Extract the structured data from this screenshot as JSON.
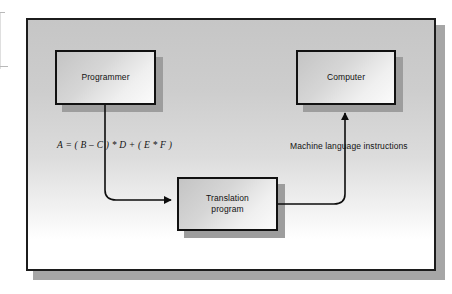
{
  "figure": {
    "type": "block-flow-diagram",
    "background_top_color": "#c6c6c6",
    "background_bottom_color": "#ffffff",
    "frame_border_color": "#1c1c1c",
    "node_border_color": "#111111",
    "shadow_color": "#9d9d9d",
    "connector_color": "#0d0d0d"
  },
  "nodes": {
    "programmer": {
      "label": "Programmer"
    },
    "computer": {
      "label": "Computer"
    },
    "translation": {
      "label_line1": "Translation",
      "label_line2": "program"
    }
  },
  "labels": {
    "formula": "A = ( B – C ) * D + ( E * F )",
    "machine_instructions": "Machine language instructions"
  },
  "connectors": [
    {
      "name": "programmer-to-translation",
      "from": "programmer",
      "to": "translation",
      "arrowhead": "translation-left",
      "annotation": "A = ( B – C ) * D + ( E * F )"
    },
    {
      "name": "translation-to-computer",
      "from": "translation",
      "to": "computer",
      "arrowhead": "computer-bottom",
      "annotation": "Machine language instructions"
    }
  ]
}
